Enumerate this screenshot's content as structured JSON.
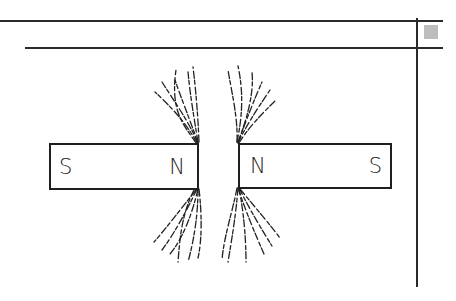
{
  "frame": {
    "top_rule": {
      "y": 20,
      "x1": 0,
      "x2": 443
    },
    "second_rule": {
      "y": 47,
      "x1": 25,
      "x2": 443
    },
    "vertical_rule": {
      "x": 416,
      "y1": 18,
      "y2": 287
    },
    "corner_icon": "hatched-square-icon"
  },
  "diagram": {
    "magnets": [
      {
        "id": "left",
        "left_label": "S",
        "right_label": "N"
      },
      {
        "id": "right",
        "left_label": "N",
        "right_label": "S"
      }
    ],
    "line_color": "#222222"
  }
}
